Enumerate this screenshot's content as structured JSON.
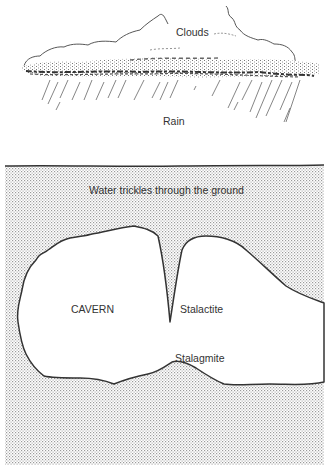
{
  "diagram": {
    "labels": {
      "clouds": "Clouds",
      "rain": "Rain",
      "ground": "Water trickles through the ground",
      "cavern": "CAVERN",
      "stalactite": "Stalactite",
      "stalagmite": "Stalagmite"
    },
    "colors": {
      "ink": "#3a3a3a",
      "stipple": "#9a9a9a",
      "background": "#ffffff"
    }
  }
}
